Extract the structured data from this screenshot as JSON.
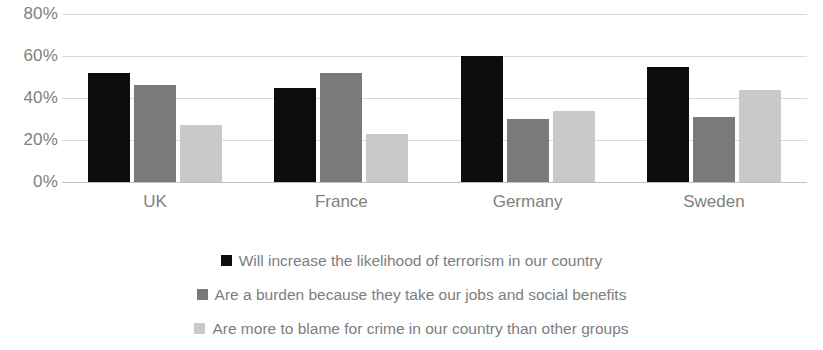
{
  "chart_data": {
    "type": "bar",
    "title": "",
    "subtitle": "",
    "xlabel": "",
    "ylabel": "",
    "categories": [
      "UK",
      "France",
      "Germany",
      "Sweden"
    ],
    "series": [
      {
        "name": "Will increase the likelihood of terrorism in our country",
        "color": "#0d0d0d",
        "values": [
          52,
          45,
          60,
          55
        ]
      },
      {
        "name": "Are a burden because they take our jobs and social benefits",
        "color": "#7a7a7a",
        "values": [
          46,
          52,
          30,
          31
        ]
      },
      {
        "name": "Are more to blame for crime in our country than other groups",
        "color": "#c9c9c9",
        "values": [
          27,
          23,
          34,
          44
        ]
      }
    ],
    "ylim": [
      0,
      80
    ],
    "ytick_values": [
      80,
      60,
      40,
      20,
      0
    ],
    "ytick_labels": [
      "80%",
      "60%",
      "40%",
      "20%",
      "0%"
    ],
    "grid": true,
    "legend_position": "bottom",
    "value_suffix": "%"
  }
}
